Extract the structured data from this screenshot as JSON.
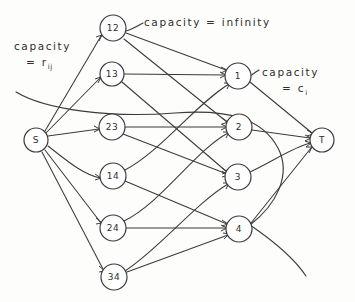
{
  "figure": {
    "background_color": "#fdfdfc",
    "ink_color": "#3b3b3b"
  },
  "annotations": [
    {
      "id": "capacity-infinity",
      "text": "capacity = infinity",
      "word_capacity": "capacity",
      "equals": "=",
      "value": "infinity"
    },
    {
      "id": "capacity-rij",
      "word_capacity": "capacity",
      "equals": "=",
      "value": "r",
      "subscript": "ij"
    },
    {
      "id": "capacity-ci",
      "word_capacity": "capacity",
      "equals": "=",
      "value": "c",
      "subscript": "i"
    }
  ],
  "nodes": {
    "source": {
      "label": "S",
      "cx": 36,
      "cy": 140,
      "r": 12
    },
    "sink": {
      "label": "T",
      "cx": 322,
      "cy": 140,
      "r": 12
    },
    "pair_nodes": [
      {
        "label": "12",
        "cx": 113,
        "cy": 28,
        "r": 13
      },
      {
        "label": "13",
        "cx": 112,
        "cy": 74,
        "r": 12
      },
      {
        "label": "23",
        "cx": 112,
        "cy": 127,
        "r": 13
      },
      {
        "label": "14",
        "cx": 113,
        "cy": 176,
        "r": 13
      },
      {
        "label": "24",
        "cx": 113,
        "cy": 228,
        "r": 13
      },
      {
        "label": "34",
        "cx": 114,
        "cy": 277,
        "r": 13
      }
    ],
    "index_nodes": [
      {
        "label": "1",
        "cx": 238,
        "cy": 76,
        "r": 13
      },
      {
        "label": "2",
        "cx": 239,
        "cy": 127,
        "r": 13
      },
      {
        "label": "3",
        "cx": 238,
        "cy": 177,
        "r": 13
      },
      {
        "label": "4",
        "cx": 239,
        "cy": 229,
        "r": 13
      }
    ]
  },
  "edges": {
    "source_to_pairs": [
      {
        "from": "S",
        "to": "12"
      },
      {
        "from": "S",
        "to": "13"
      },
      {
        "from": "S",
        "to": "23"
      },
      {
        "from": "S",
        "to": "14"
      },
      {
        "from": "S",
        "to": "24"
      },
      {
        "from": "S",
        "to": "34"
      }
    ],
    "pairs_to_indices": [
      {
        "from": "12",
        "to": "1"
      },
      {
        "from": "12",
        "to": "2"
      },
      {
        "from": "13",
        "to": "1"
      },
      {
        "from": "13",
        "to": "3"
      },
      {
        "from": "23",
        "to": "2"
      },
      {
        "from": "23",
        "to": "3"
      },
      {
        "from": "14",
        "to": "1"
      },
      {
        "from": "14",
        "to": "4"
      },
      {
        "from": "24",
        "to": "2"
      },
      {
        "from": "24",
        "to": "4"
      },
      {
        "from": "34",
        "to": "3"
      },
      {
        "from": "34",
        "to": "4"
      }
    ],
    "indices_to_sink": [
      {
        "from": "1",
        "to": "T"
      },
      {
        "from": "2",
        "to": "T"
      },
      {
        "from": "3",
        "to": "T"
      },
      {
        "from": "4",
        "to": "T"
      }
    ]
  }
}
